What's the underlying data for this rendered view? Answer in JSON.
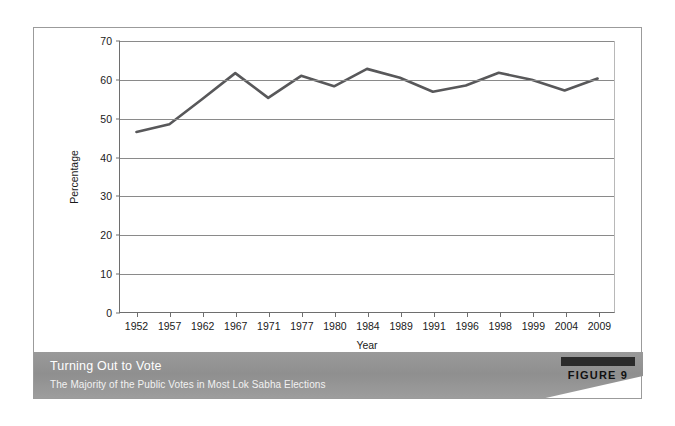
{
  "caption": {
    "title": "Turning Out to Vote",
    "subtitle": "The Majority of the Public Votes in Most Lok Sabha Elections",
    "figure_label": "FIGURE 9"
  },
  "colors": {
    "line": "#58585a",
    "grid": "#8a8a8a",
    "axis": "#6e6e6e",
    "banner": "#949494",
    "frame": "#9b9b9b"
  },
  "chart_data": {
    "type": "line",
    "title": "Turning Out to Vote",
    "subtitle": "The Majority of the Public Votes in Most Lok Sabha Elections",
    "xlabel": "Year",
    "ylabel": "Percentage",
    "categories": [
      "1952",
      "1957",
      "1962",
      "1967",
      "1971",
      "1977",
      "1980",
      "1984",
      "1989",
      "1991",
      "1996",
      "1998",
      "1999",
      "2004",
      "2009"
    ],
    "values": [
      46.5,
      48.5,
      55.0,
      61.7,
      55.3,
      61.0,
      58.3,
      62.8,
      60.5,
      56.9,
      58.5,
      61.8,
      60.0,
      57.2,
      60.3
    ],
    "ylim": [
      0,
      70
    ],
    "yticks": [
      0,
      10,
      20,
      30,
      40,
      50,
      60,
      70
    ],
    "ytick_labels": [
      "0",
      "10",
      "20",
      "30",
      "40",
      "50",
      "60",
      "70"
    ],
    "grid": true,
    "grid_axis": "y",
    "legend": false,
    "series": [
      {
        "name": "Voter turnout",
        "values": [
          46.5,
          48.5,
          55.0,
          61.7,
          55.3,
          61.0,
          58.3,
          62.8,
          60.5,
          56.9,
          58.5,
          61.8,
          60.0,
          57.2,
          60.3
        ]
      }
    ]
  }
}
